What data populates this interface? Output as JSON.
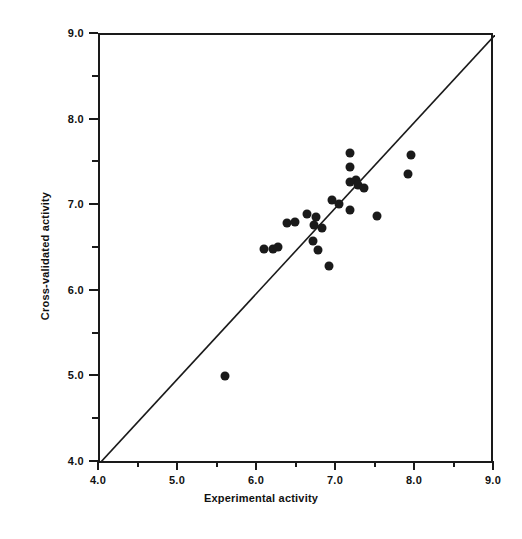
{
  "chart_data": {
    "type": "scatter",
    "title": "",
    "xlabel": "Experimental activity",
    "ylabel": "Cross-validated activity",
    "xlim": [
      4.0,
      9.0
    ],
    "ylim": [
      4.0,
      9.0
    ],
    "grid": false,
    "legend": null,
    "xticks": [
      4.0,
      5.0,
      6.0,
      7.0,
      8.0,
      9.0
    ],
    "yticks": [
      4.0,
      5.0,
      6.0,
      7.0,
      8.0,
      9.0
    ],
    "xtick_labels": [
      "4.0",
      "5.0",
      "6.0",
      "7.0",
      "8.0",
      "9.0"
    ],
    "ytick_labels": [
      "4.0",
      "5.0",
      "6.0",
      "7.0",
      "8.0",
      "9.0"
    ],
    "minor_tick_step": 0.5,
    "annotations": [
      {
        "type": "line",
        "name": "identity-line",
        "from": [
          4.0,
          4.0
        ],
        "to": [
          9.0,
          9.0
        ]
      }
    ],
    "marker": {
      "shape": "circle",
      "filled": true,
      "color": "#1a1a1a",
      "size_px": 9
    },
    "points": [
      {
        "x": 5.58,
        "y": 5.02
      },
      {
        "x": 6.08,
        "y": 6.5
      },
      {
        "x": 6.19,
        "y": 6.5
      },
      {
        "x": 6.25,
        "y": 6.52
      },
      {
        "x": 6.37,
        "y": 6.8
      },
      {
        "x": 6.47,
        "y": 6.81
      },
      {
        "x": 6.62,
        "y": 6.91
      },
      {
        "x": 6.74,
        "y": 6.87
      },
      {
        "x": 6.71,
        "y": 6.78
      },
      {
        "x": 6.81,
        "y": 6.74
      },
      {
        "x": 6.7,
        "y": 6.59
      },
      {
        "x": 6.76,
        "y": 6.49
      },
      {
        "x": 6.9,
        "y": 6.3
      },
      {
        "x": 6.94,
        "y": 7.07
      },
      {
        "x": 7.02,
        "y": 7.02
      },
      {
        "x": 7.16,
        "y": 7.46
      },
      {
        "x": 7.17,
        "y": 7.62
      },
      {
        "x": 7.24,
        "y": 7.31
      },
      {
        "x": 7.16,
        "y": 7.28
      },
      {
        "x": 7.27,
        "y": 7.25
      },
      {
        "x": 7.34,
        "y": 7.21
      },
      {
        "x": 7.17,
        "y": 6.96
      },
      {
        "x": 7.5,
        "y": 6.88
      },
      {
        "x": 7.94,
        "y": 7.6
      },
      {
        "x": 7.9,
        "y": 7.38
      }
    ]
  }
}
